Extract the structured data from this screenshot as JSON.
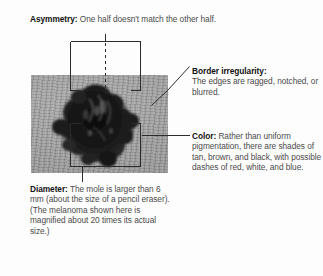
{
  "figure": {
    "background_color": "#fdfdfd",
    "text_color": "#4b4b4b",
    "lead_color": "#111111",
    "line_color": "#2b2b2b"
  },
  "callouts": {
    "asymmetry": {
      "lead": "Asymmetry:",
      "body": " One half doesn't match the other half."
    },
    "border": {
      "lead": "Border irregularity:",
      "body": "The edges are ragged, notched, or blurred."
    },
    "color": {
      "lead": "Color:",
      "body": " Rather than uniform pigmentation, there are shades of tan, brown, and black, with possible dashes of red, white, and blue."
    },
    "diameter": {
      "lead": "Diameter:",
      "body": " The mole is larger than 6 mm (about the size of a pencil eraser). (The melanoma shown here is magnified about 20 times its actual size.)"
    }
  },
  "photo": {
    "caption": "magnified melanoma lesion on skin",
    "skin_color": "#9d9d9d",
    "lesion_color": "#151515"
  },
  "annotations": {
    "asymmetry_bracket": "rectangle split by dashed vertical midline over upper half of lesion",
    "diameter_bracket": "rectangle spanning width of lesion with drop line to caption",
    "border_leader": "diagonal leader line from lesion edge to border text",
    "color_leader": "horizontal leader line from lesion to color text"
  }
}
